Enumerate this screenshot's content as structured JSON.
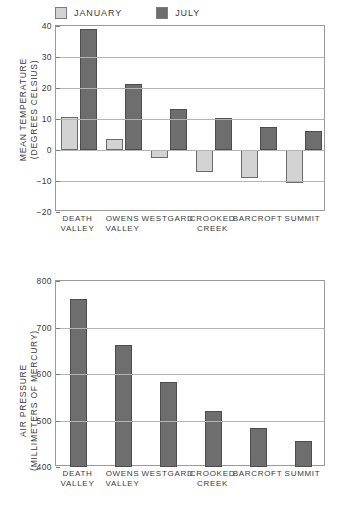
{
  "chart_data": [
    {
      "id": "temperature",
      "type": "bar",
      "title": "",
      "xlabel": "",
      "ylabel": "MEAN TEMPERATURE\n(DEGREES CELSIUS)",
      "ylim": [
        -20,
        40
      ],
      "yticks": [
        "40",
        "30",
        "20",
        "10",
        "0",
        "−10",
        "−20"
      ],
      "ytick_values": [
        40,
        30,
        20,
        10,
        0,
        -10,
        -20
      ],
      "grid": true,
      "legend_position": "above-left",
      "categories": [
        "DEATH\nVALLEY",
        "OWENS\nVALLEY",
        "WESTGARD",
        "CROOKED\nCREEK",
        "BARCROFT",
        "SUMMIT"
      ],
      "series": [
        {
          "name": "JANUARY",
          "color": "#d3d3d3",
          "values": [
            10.5,
            3.5,
            -2.5,
            -7.0,
            -9.0,
            -10.5
          ]
        },
        {
          "name": "JULY",
          "color": "#6e6e6e",
          "values": [
            39.0,
            21.2,
            13.3,
            10.2,
            7.3,
            6.2
          ]
        }
      ]
    },
    {
      "id": "pressure",
      "type": "bar",
      "title": "",
      "xlabel": "",
      "ylabel": "AIR PRESSURE\n(MILLIMETERS OF MERCURY)",
      "ylim": [
        400,
        800
      ],
      "yticks": [
        "800",
        "700",
        "600",
        "500",
        "400"
      ],
      "ytick_values": [
        800,
        700,
        600,
        500,
        400
      ],
      "grid": true,
      "legend_position": "none",
      "categories": [
        "DEATH\nVALLEY",
        "OWENS\nVALLEY",
        "WESTGARD",
        "CROOKED\nCREEK",
        "BARCROFT",
        "SUMMIT"
      ],
      "series": [
        {
          "name": "AIR PRESSURE",
          "color": "#6e6e6e",
          "values": [
            762,
            662,
            583,
            520,
            483,
            455
          ]
        }
      ]
    }
  ],
  "legend": {
    "entries": [
      {
        "label": "JANUARY",
        "color": "#d3d3d3"
      },
      {
        "label": "JULY",
        "color": "#6e6e6e"
      }
    ]
  },
  "colors": {
    "january": "#d3d3d3",
    "july": "#6e6e6e",
    "grid": "#b4b4b4",
    "frame": "#9a9a9a",
    "text": "#3a3a3a",
    "background": "#ffffff"
  }
}
